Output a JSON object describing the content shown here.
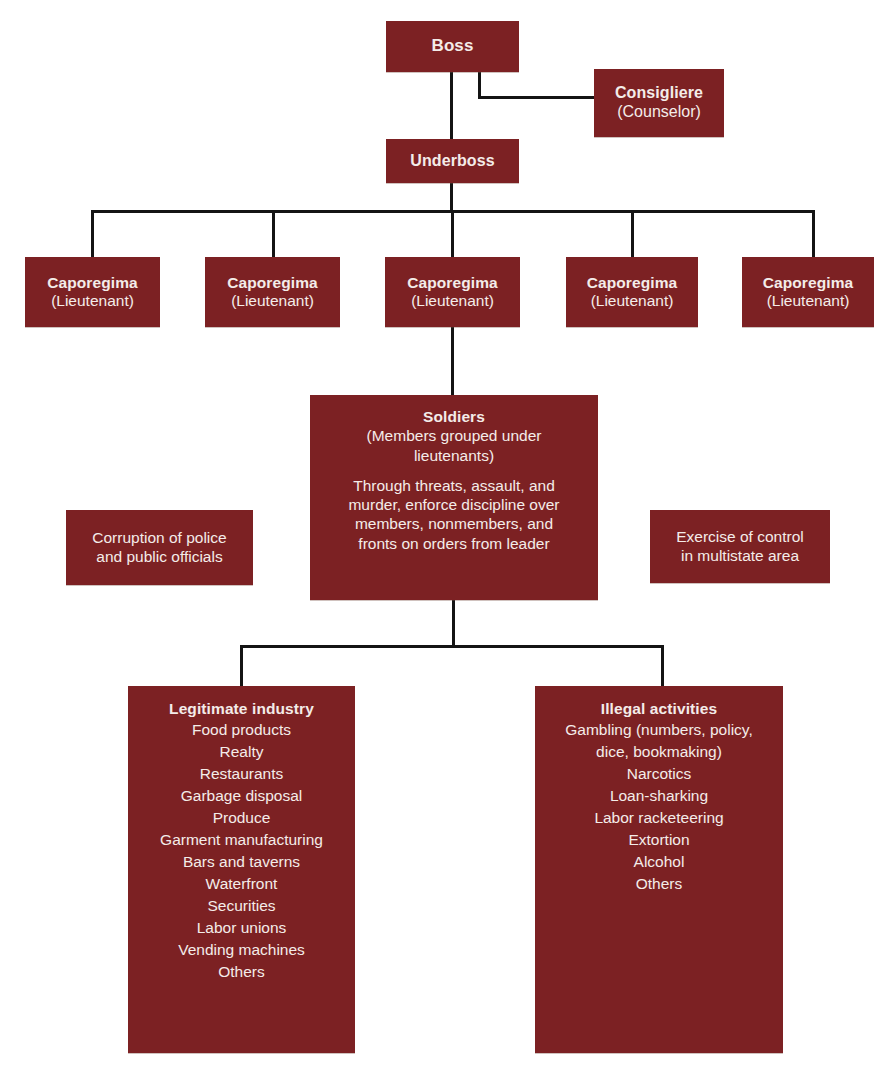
{
  "diagram": {
    "title_strip": "",
    "accent_color": "#7c2123",
    "line_color": "#141414",
    "text_color": "#f4ece9",
    "background": "#ffffff"
  },
  "nodes": {
    "boss": {
      "title": "Boss",
      "subtitle": ""
    },
    "consigliere": {
      "title": "Consigliere",
      "subtitle": "(Counselor)"
    },
    "underboss": {
      "title": "Underboss",
      "subtitle": ""
    },
    "caporegima": [
      {
        "title": "Caporegima",
        "subtitle": "(Lieutenant)"
      },
      {
        "title": "Caporegima",
        "subtitle": "(Lieutenant)"
      },
      {
        "title": "Caporegima",
        "subtitle": "(Lieutenant)"
      },
      {
        "title": "Caporegima",
        "subtitle": "(Lieutenant)"
      },
      {
        "title": "Caporegima",
        "subtitle": "(Lieutenant)"
      }
    ],
    "soldiers": {
      "title": "Soldiers",
      "subtitle_line1": "(Members grouped under",
      "subtitle_line2": "lieutenants)",
      "paragraph_line1": "Through threats, assault, and",
      "paragraph_line2": "murder, enforce discipline over",
      "paragraph_line3": "members, nonmembers, and",
      "paragraph_line4": "fronts on orders from leader"
    },
    "note_left": {
      "line1": "Corruption of police",
      "line2": "and public officials"
    },
    "note_right": {
      "line1": "Exercise of control",
      "line2": "in multistate area"
    },
    "legitimate_industry": {
      "title": "Legitimate industry",
      "items": [
        "Food products",
        "Realty",
        "Restaurants",
        "Garbage disposal",
        "Produce",
        "Garment manufacturing",
        "Bars and taverns",
        "Waterfront",
        "Securities",
        "Labor unions",
        "Vending machines",
        "Others"
      ]
    },
    "illegal_activities": {
      "title": "Illegal activities",
      "items": [
        "Gambling (numbers, policy,",
        "dice, bookmaking)",
        "Narcotics",
        "Loan-sharking",
        "Labor racketeering",
        "Extortion",
        "Alcohol",
        "Others"
      ]
    }
  }
}
